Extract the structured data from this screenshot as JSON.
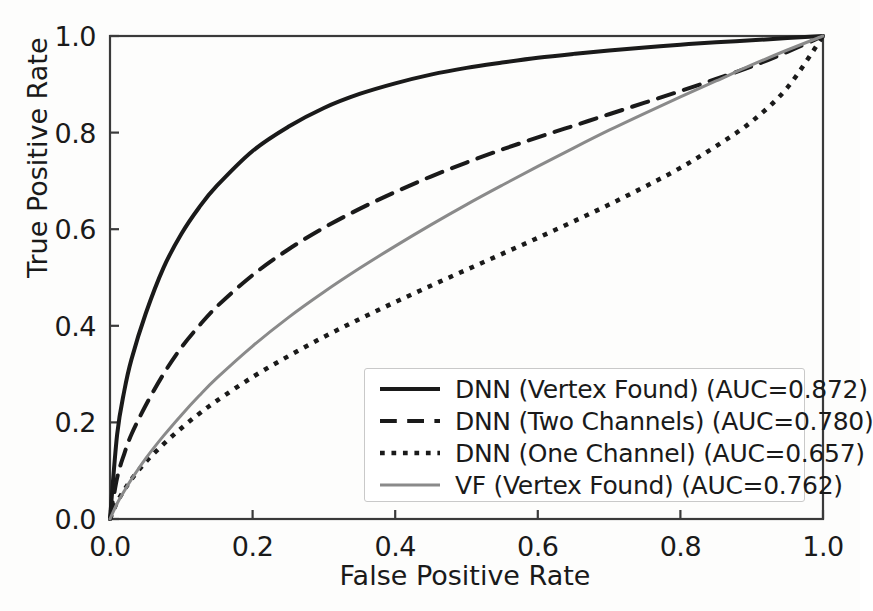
{
  "chart_data": {
    "type": "line",
    "title": "",
    "xlabel": "False Positive Rate",
    "ylabel": "True Positive Rate",
    "xlim": [
      0.0,
      1.0
    ],
    "ylim": [
      0.0,
      1.0
    ],
    "xticks": [
      "0.0",
      "0.2",
      "0.4",
      "0.6",
      "0.8",
      "1.0"
    ],
    "yticks": [
      "0.0",
      "0.2",
      "0.4",
      "0.6",
      "0.8",
      "1.0"
    ],
    "xtick_values": [
      0.0,
      0.2,
      0.4,
      0.6,
      0.8,
      1.0
    ],
    "ytick_values": [
      0.0,
      0.2,
      0.4,
      0.6,
      0.8,
      1.0
    ],
    "grid": false,
    "legend_position": "lower right",
    "x": [
      0.0,
      0.01,
      0.02,
      0.03,
      0.05,
      0.075,
      0.1,
      0.125,
      0.15,
      0.2,
      0.25,
      0.3,
      0.35,
      0.4,
      0.45,
      0.5,
      0.55,
      0.6,
      0.65,
      0.7,
      0.75,
      0.8,
      0.85,
      0.9,
      0.95,
      1.0
    ],
    "series": [
      {
        "name": "DNN (Vertex Found)",
        "auc": 0.872,
        "style": "solid",
        "color": "#1a1a1a",
        "linewidth": 4,
        "values": [
          0.0,
          0.175,
          0.265,
          0.33,
          0.425,
          0.52,
          0.59,
          0.645,
          0.69,
          0.762,
          0.812,
          0.851,
          0.88,
          0.902,
          0.92,
          0.934,
          0.945,
          0.955,
          0.963,
          0.97,
          0.976,
          0.982,
          0.987,
          0.991,
          0.996,
          1.0
        ]
      },
      {
        "name": "DNN (Two Channels)",
        "auc": 0.78,
        "style": "dashed",
        "color": "#1a1a1a",
        "linewidth": 4,
        "values": [
          0.0,
          0.085,
          0.135,
          0.175,
          0.235,
          0.3,
          0.355,
          0.4,
          0.44,
          0.505,
          0.558,
          0.603,
          0.642,
          0.677,
          0.709,
          0.738,
          0.765,
          0.79,
          0.814,
          0.838,
          0.862,
          0.886,
          0.911,
          0.937,
          0.967,
          1.0
        ]
      },
      {
        "name": "DNN (One Channel)",
        "auc": 0.657,
        "style": "dotted",
        "color": "#1a1a1a",
        "linewidth": 4.5,
        "values": [
          0.0,
          0.035,
          0.06,
          0.082,
          0.118,
          0.155,
          0.188,
          0.218,
          0.245,
          0.294,
          0.337,
          0.377,
          0.414,
          0.449,
          0.483,
          0.516,
          0.549,
          0.582,
          0.616,
          0.651,
          0.688,
          0.727,
          0.772,
          0.823,
          0.893,
          1.0
        ]
      },
      {
        "name": "VF (Vertex Found)",
        "auc": 0.762,
        "style": "solid",
        "color": "#8a8a8a",
        "linewidth": 3,
        "values": [
          0.0,
          0.032,
          0.058,
          0.082,
          0.125,
          0.172,
          0.215,
          0.255,
          0.292,
          0.358,
          0.417,
          0.47,
          0.519,
          0.565,
          0.609,
          0.651,
          0.691,
          0.73,
          0.768,
          0.805,
          0.84,
          0.874,
          0.907,
          0.94,
          0.971,
          1.0
        ]
      }
    ],
    "legend_entries": [
      "DNN (Vertex Found) (AUC=0.872)",
      "DNN (Two Channels) (AUC=0.780)",
      "DNN (One Channel) (AUC=0.657)",
      "VF (Vertex Found) (AUC=0.762)"
    ]
  },
  "axis": {
    "spine_color": "#3a3a3a",
    "background": "#fdfdfc"
  }
}
